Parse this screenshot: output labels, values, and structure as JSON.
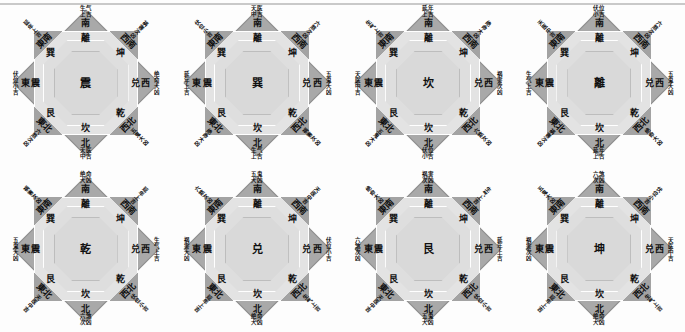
{
  "page": {
    "background_color": "#fdfdfd",
    "diagram_count": 8,
    "rows": 2,
    "columns": 4
  },
  "common": {
    "directions": {
      "n": "南",
      "ne": "西南",
      "e": "西",
      "se": "西北",
      "s": "北",
      "sw": "東北",
      "w": "東",
      "nw": "東南"
    },
    "inner_trigrams": {
      "n": "離",
      "ne": "坤",
      "e": "兑",
      "se": "乾",
      "s": "坎",
      "sw": "艮",
      "w": "震",
      "nw": "巽"
    },
    "palette": {
      "diamond": "#a9a9a9",
      "square": "#e3e3e3",
      "octagon": "#dedede",
      "inner_octagon": "#d9d9d9",
      "text": "#101010",
      "rule": "#c9c9c9"
    }
  },
  "diagrams": [
    {
      "index": 1,
      "center": "震",
      "stars": {
        "n": {
          "name": "生气",
          "grade": "上吉"
        },
        "s": {
          "name": "天医",
          "grade": "中吉"
        },
        "w": {
          "name": "伏位",
          "grade": "小吉"
        },
        "e": {
          "name": "绝命",
          "grade": "大凶"
        },
        "nw": {
          "name": "延年",
          "grade": "上吉"
        },
        "ne": {
          "name": "祸害",
          "grade": "次凶"
        },
        "sw": {
          "name": "六煞",
          "grade": "次凶"
        },
        "se": {
          "name": "五鬼",
          "grade": "大凶"
        }
      }
    },
    {
      "index": 2,
      "center": "巽",
      "stars": {
        "n": {
          "name": "天医",
          "grade": "中吉"
        },
        "s": {
          "name": "生气",
          "grade": "上吉"
        },
        "w": {
          "name": "延年",
          "grade": "上吉"
        },
        "e": {
          "name": "五鬼",
          "grade": "大凶"
        },
        "nw": {
          "name": "伏位",
          "grade": "小吉"
        },
        "ne": {
          "name": "六煞",
          "grade": "次凶"
        },
        "sw": {
          "name": "绝命",
          "grade": "大凶"
        },
        "se": {
          "name": "祸害",
          "grade": "次凶"
        }
      }
    },
    {
      "index": 3,
      "center": "坎",
      "stars": {
        "n": {
          "name": "延年",
          "grade": "上吉"
        },
        "s": {
          "name": "伏位",
          "grade": "小吉"
        },
        "w": {
          "name": "天医",
          "grade": "中吉"
        },
        "e": {
          "name": "祸害",
          "grade": "次凶"
        },
        "nw": {
          "name": "生气",
          "grade": "上吉"
        },
        "ne": {
          "name": "绝命",
          "grade": "大凶"
        },
        "sw": {
          "name": "五鬼",
          "grade": "大凶"
        },
        "se": {
          "name": "六煞",
          "grade": "次凶"
        }
      }
    },
    {
      "index": 4,
      "center": "離",
      "stars": {
        "n": {
          "name": "伏位",
          "grade": "小吉"
        },
        "s": {
          "name": "延年",
          "grade": "上吉"
        },
        "w": {
          "name": "生气",
          "grade": "上吉"
        },
        "e": {
          "name": "五鬼",
          "grade": "大凶"
        },
        "nw": {
          "name": "天医",
          "grade": "中吉"
        },
        "ne": {
          "name": "六煞",
          "grade": "次凶"
        },
        "sw": {
          "name": "祸害",
          "grade": "次凶"
        },
        "se": {
          "name": "绝命",
          "grade": "大凶"
        }
      }
    },
    {
      "index": 5,
      "center": "乾",
      "stars": {
        "n": {
          "name": "绝命",
          "grade": "大凶"
        },
        "s": {
          "name": "六煞",
          "grade": "次凶"
        },
        "w": {
          "name": "五鬼",
          "grade": "大凶"
        },
        "e": {
          "name": "生气",
          "grade": "上吉"
        },
        "nw": {
          "name": "祸害",
          "grade": "次凶"
        },
        "ne": {
          "name": "延年",
          "grade": "上吉"
        },
        "sw": {
          "name": "天医",
          "grade": "中吉"
        },
        "se": {
          "name": "伏位",
          "grade": "小吉"
        }
      }
    },
    {
      "index": 6,
      "center": "兑",
      "stars": {
        "n": {
          "name": "五鬼",
          "grade": "大凶"
        },
        "s": {
          "name": "绝命",
          "grade": "大凶"
        },
        "w": {
          "name": "祸害",
          "grade": "大凶"
        },
        "e": {
          "name": "伏位",
          "grade": "小吉"
        },
        "nw": {
          "name": "六煞",
          "grade": "次凶"
        },
        "ne": {
          "name": "天医",
          "grade": "中吉"
        },
        "sw": {
          "name": "延年",
          "grade": "上吉"
        },
        "se": {
          "name": "生气",
          "grade": "上吉"
        }
      }
    },
    {
      "index": 7,
      "center": "艮",
      "stars": {
        "n": {
          "name": "祸害",
          "grade": "次凶"
        },
        "s": {
          "name": "五鬼",
          "grade": "大凶"
        },
        "w": {
          "name": "六煞",
          "grade": "次凶"
        },
        "e": {
          "name": "延年",
          "grade": "上吉"
        },
        "nw": {
          "name": "绝命",
          "grade": "大凶"
        },
        "ne": {
          "name": "生气",
          "grade": "上吉"
        },
        "sw": {
          "name": "天医",
          "grade": "中吉"
        },
        "se": {
          "name": "伏位",
          "grade": "小吉"
        }
      }
    },
    {
      "index": 8,
      "center": "坤",
      "stars": {
        "n": {
          "name": "六煞",
          "grade": "次凶"
        },
        "s": {
          "name": "绝命",
          "grade": "大凶"
        },
        "w": {
          "name": "祸害",
          "grade": "次凶"
        },
        "e": {
          "name": "天医",
          "grade": "中吉"
        },
        "nw": {
          "name": "五鬼",
          "grade": "大凶"
        },
        "ne": {
          "name": "伏位",
          "grade": "小吉"
        },
        "sw": {
          "name": "延年",
          "grade": "上吉"
        },
        "se": {
          "name": "生气",
          "grade": "上吉"
        }
      }
    }
  ]
}
